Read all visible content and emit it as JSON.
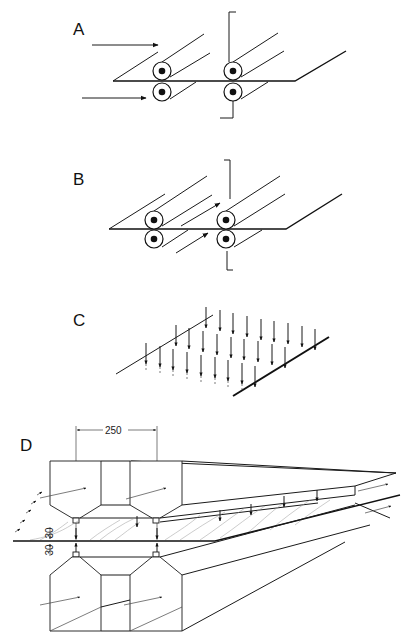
{
  "figure": {
    "panels": [
      {
        "id": "A",
        "label": "A",
        "description": "Two roller pairs nipping a web; air flow directed toward rollers from the left (two arrows)"
      },
      {
        "id": "B",
        "label": "B",
        "description": "Two roller pairs nipping a web; air flow directed along the web between roller pairs (two diagonal arrows)"
      },
      {
        "id": "C",
        "label": "C",
        "description": "Web section with a grid of downward-pointing arrows indicating air impingement"
      },
      {
        "id": "D",
        "label": "D",
        "description": "Nozzle boxes above and below the web, with flow arrows and hatched air layer"
      }
    ],
    "dimensions": {
      "nozzle_spacing": "250",
      "gap_above": "30",
      "gap_below": "30"
    },
    "colors": {
      "line": "#1a1a1a",
      "background": "#ffffff",
      "hatch": "#999999"
    }
  }
}
